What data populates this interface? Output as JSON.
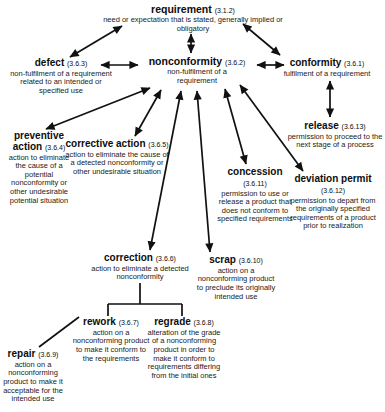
{
  "colors": {
    "ink": "#111111",
    "background": "#ffffff"
  },
  "nodes": {
    "requirement": {
      "term": "requirement",
      "number": "(3.1.2)",
      "definition": "need or expectation that is stated, generally implied or obligatory"
    },
    "nonconformity": {
      "term": "nonconformity",
      "number": "(3.6.2)",
      "definition": "non-fulfilment of a requirement"
    },
    "defect": {
      "term": "defect",
      "number": "(3.6.3)",
      "definition": "non-fulfilment of a requirement related to an intended or specified use"
    },
    "conformity": {
      "term": "conformity",
      "number": "(3.6.1)",
      "definition": "fulfilment of a requirement"
    },
    "release": {
      "term": "release",
      "number": "(3.6.13)",
      "definition": "permission to proceed to the next stage of a process"
    },
    "preventive_action": {
      "term": "preventive action",
      "number": "(3.6.4)",
      "definition": "action to eliminate the cause of a potential nonconformity or other undesirable potential situation"
    },
    "corrective_action": {
      "term": "corrective action",
      "number": "(3.6.5)",
      "definition": "action to eliminate the cause of a detected nonconformity or other undesirable situation"
    },
    "concession": {
      "term": "concession",
      "number": "(3.6.11)",
      "definition": "permission to use or release a product that does not conform to specified requirements"
    },
    "deviation_permit": {
      "term": "deviation permit",
      "number": "(3.6.12)",
      "definition": "permission to depart from the originally specified requirements of a product prior to realization"
    },
    "correction": {
      "term": "correction",
      "number": "(3.6.6)",
      "definition": "action to eliminate a detected nonconformity"
    },
    "scrap": {
      "term": "scrap",
      "number": "(3.6.10)",
      "definition": "action on a nonconforming product to preclude its originally intended use"
    },
    "rework": {
      "term": "rework",
      "number": "(3.6.7)",
      "definition": "action on a nonconforming product to make it conform to the requirements"
    },
    "regrade": {
      "term": "regrade",
      "number": "(3.6.8)",
      "definition": "alteration of the grade of a nonconforming product in order to make it conform to requirements differing from the initial ones"
    },
    "repair": {
      "term": "repair",
      "number": "(3.6.9)",
      "definition": "action on a nonconforming product to make it acceptable for the intended use"
    }
  },
  "relations": [
    {
      "from": "requirement",
      "to": "nonconformity",
      "style": "double-arrow"
    },
    {
      "from": "requirement",
      "to": "defect",
      "style": "double-arrow"
    },
    {
      "from": "requirement",
      "to": "conformity",
      "style": "double-arrow"
    },
    {
      "from": "defect",
      "to": "nonconformity",
      "style": "double-arrow"
    },
    {
      "from": "nonconformity",
      "to": "conformity",
      "style": "double-arrow"
    },
    {
      "from": "conformity",
      "to": "release",
      "style": "double-arrow"
    },
    {
      "from": "nonconformity",
      "to": "preventive_action",
      "style": "double-arrow"
    },
    {
      "from": "nonconformity",
      "to": "corrective_action",
      "style": "double-arrow"
    },
    {
      "from": "nonconformity",
      "to": "correction",
      "style": "double-arrow"
    },
    {
      "from": "nonconformity",
      "to": "scrap",
      "style": "double-arrow"
    },
    {
      "from": "nonconformity",
      "to": "concession",
      "style": "double-arrow"
    },
    {
      "from": "nonconformity",
      "to": "deviation_permit",
      "style": "double-arrow"
    },
    {
      "from": "correction",
      "to": "rework",
      "style": "tree-connector"
    },
    {
      "from": "correction",
      "to": "regrade",
      "style": "tree-connector"
    },
    {
      "from": "repair",
      "to": "rework",
      "style": "plain-line"
    }
  ]
}
